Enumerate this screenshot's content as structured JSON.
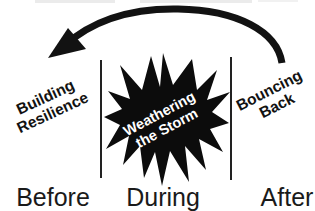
{
  "diagram": {
    "stages": [
      {
        "phase": "Before",
        "annotation_lines": [
          "Building",
          "Resilience"
        ]
      },
      {
        "phase": "During",
        "annotation_lines": [
          "Weathering",
          "the Storm"
        ]
      },
      {
        "phase": "After",
        "annotation_lines": [
          "Bouncing",
          "Back"
        ]
      }
    ],
    "colors": {
      "ink": "#121212",
      "background": "#ffffff",
      "burst_fill": "#0c0c0c",
      "burst_text": "#ffffff"
    }
  }
}
